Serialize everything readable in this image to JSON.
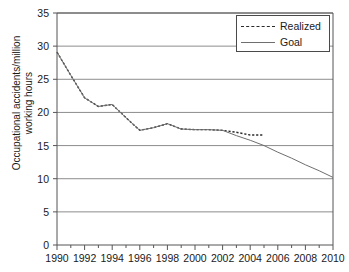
{
  "chart_data": {
    "type": "line",
    "title": "",
    "xlabel": "",
    "ylabel": "Occupational accidents/million\nworking hours",
    "xlim": [
      1990,
      2010
    ],
    "ylim": [
      0,
      35
    ],
    "ytick_step": 5,
    "xtick_step": 2,
    "x_minor_tick_step": 1,
    "grid": "horizontal",
    "legend_position": "top-right",
    "yticks": [
      "0",
      "5",
      "10",
      "15",
      "20",
      "25",
      "30",
      "35"
    ],
    "xticks": [
      "1990",
      "1992",
      "1994",
      "1996",
      "1998",
      "2000",
      "2002",
      "2004",
      "2006",
      "2008",
      "2010"
    ],
    "series": [
      {
        "name": "Realized",
        "style": "dashed",
        "color": "#2a2a2a",
        "x": [
          1990,
          1991,
          1992,
          1993,
          1994,
          1995,
          1996,
          1997,
          1998,
          1999,
          2000,
          2001,
          2002,
          2003,
          2004,
          2005
        ],
        "values": [
          29.1,
          25.6,
          22.2,
          20.9,
          21.2,
          19.2,
          17.3,
          17.7,
          18.3,
          17.5,
          17.4,
          17.4,
          17.3,
          17.0,
          16.6,
          16.6
        ]
      },
      {
        "name": "Goal",
        "style": "solid",
        "color": "#6e6e6e",
        "x": [
          1990,
          1991,
          1992,
          1993,
          1994,
          1995,
          1996,
          1997,
          1998,
          1999,
          2000,
          2001,
          2002,
          2003,
          2004,
          2005,
          2006,
          2007,
          2008,
          2009,
          2010
        ],
        "values": [
          29.1,
          25.6,
          22.2,
          20.9,
          21.2,
          19.2,
          17.3,
          17.7,
          18.3,
          17.5,
          17.4,
          17.4,
          17.3,
          16.5,
          15.8,
          15.0,
          14.0,
          13.1,
          12.1,
          11.2,
          10.2
        ]
      }
    ]
  },
  "legend": {
    "entries": [
      {
        "label": "Realized"
      },
      {
        "label": "Goal"
      }
    ]
  },
  "axis": {
    "y_title": "Occupational accidents/million\nworking hours"
  }
}
